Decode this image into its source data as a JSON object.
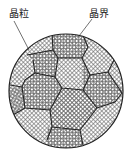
{
  "diagram": {
    "type": "microstructure",
    "labels": {
      "grain": "晶粒",
      "grain_boundary": "晶界"
    },
    "colors": {
      "line": "#333333",
      "hatch": "#555555",
      "background": "#ffffff"
    }
  }
}
